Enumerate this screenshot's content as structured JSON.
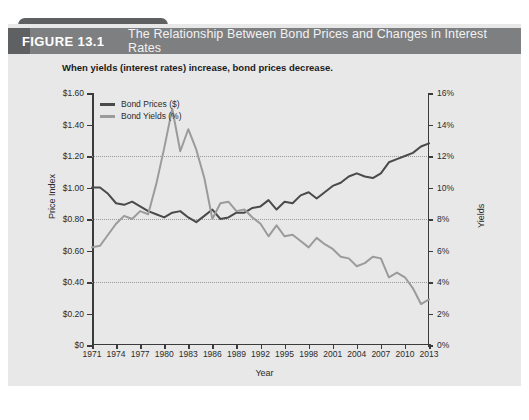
{
  "figure": {
    "number_label": "FIGURE 13.1",
    "title": "The Relationship Between Bond Prices and Changes in Interest Rates",
    "subtitle": "When yields (interest rates) increase, bond prices decrease.",
    "header_bg": "#7d7f81",
    "accent_bg": "#5f6062",
    "panel_bg": "#e8e8e8"
  },
  "chart_data": {
    "type": "line",
    "title": "The Relationship Between Bond Prices and Changes in Interest Rates",
    "subtitle": "When yields (interest rates) increase, bond prices decrease.",
    "xlabel": "Year",
    "ylabel": "Price Index",
    "y2label": "Yields",
    "grid": true,
    "legend_position": "top-left",
    "x": [
      1971,
      1972,
      1973,
      1974,
      1975,
      1976,
      1977,
      1978,
      1979,
      1980,
      1981,
      1982,
      1983,
      1984,
      1985,
      1986,
      1987,
      1988,
      1989,
      1990,
      1991,
      1992,
      1993,
      1994,
      1995,
      1996,
      1997,
      1998,
      1999,
      2000,
      2001,
      2002,
      2003,
      2004,
      2005,
      2006,
      2007,
      2008,
      2009,
      2010,
      2011,
      2012,
      2013
    ],
    "xticks": [
      1971,
      1974,
      1977,
      1980,
      1983,
      1986,
      1989,
      1992,
      1995,
      1998,
      2001,
      2004,
      2007,
      2010,
      2013
    ],
    "ylim": [
      0,
      1.6
    ],
    "yticks": [
      0,
      0.2,
      0.4,
      0.6,
      0.8,
      1.0,
      1.2,
      1.4,
      1.6
    ],
    "ytick_labels": [
      "$0",
      "$0.20",
      "$0.40",
      "$0.60",
      "$0.80",
      "$1.00",
      "$1.20",
      "$1.40",
      "$1.60"
    ],
    "y2lim": [
      0,
      16
    ],
    "y2ticks": [
      0,
      2,
      4,
      6,
      8,
      10,
      12,
      14,
      16
    ],
    "y2tick_labels": [
      "0%",
      "2%",
      "4%",
      "6%",
      "8%",
      "10%",
      "12%",
      "14%",
      "16%"
    ],
    "gridlines_at": [
      0.4,
      0.8,
      1.2
    ],
    "series": [
      {
        "name": "Bond Prices ($)",
        "axis": "left",
        "color": "#4a4a4a",
        "unit": "$",
        "values": [
          1.0,
          1.0,
          0.96,
          0.9,
          0.89,
          0.91,
          0.88,
          0.85,
          0.83,
          0.81,
          0.84,
          0.85,
          0.81,
          0.78,
          0.82,
          0.86,
          0.8,
          0.81,
          0.84,
          0.84,
          0.87,
          0.88,
          0.92,
          0.86,
          0.91,
          0.9,
          0.95,
          0.97,
          0.93,
          0.97,
          1.01,
          1.03,
          1.07,
          1.09,
          1.07,
          1.06,
          1.09,
          1.16,
          1.18,
          1.2,
          1.22,
          1.26,
          1.28
        ]
      },
      {
        "name": "Bond Yields (%)",
        "axis": "right",
        "color": "#9b9b9b",
        "unit": "%",
        "values": [
          6.2,
          6.3,
          7.0,
          7.7,
          8.2,
          8.0,
          8.5,
          8.3,
          10.2,
          12.5,
          15.0,
          12.3,
          13.7,
          12.4,
          10.6,
          8.0,
          9.0,
          9.1,
          8.5,
          8.6,
          8.1,
          7.7,
          6.9,
          7.6,
          6.9,
          7.0,
          6.6,
          6.2,
          6.8,
          6.4,
          6.1,
          5.6,
          5.5,
          5.0,
          5.2,
          5.6,
          5.5,
          4.3,
          4.6,
          4.3,
          3.6,
          2.6,
          2.9
        ]
      }
    ]
  }
}
